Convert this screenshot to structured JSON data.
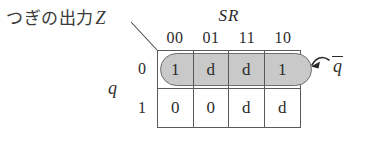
{
  "diagram": {
    "type": "karnaugh-map",
    "output_label": "つぎの出力",
    "output_variable": "Z",
    "column_variable": "SR",
    "row_variable": "q",
    "column_headers": [
      "00",
      "01",
      "11",
      "10"
    ],
    "row_headers": [
      "0",
      "1"
    ],
    "rows": [
      {
        "row_header": "0",
        "cells": [
          "1",
          "d",
          "d",
          "1"
        ]
      },
      {
        "row_header": "1",
        "cells": [
          "0",
          "0",
          "d",
          "d"
        ]
      }
    ],
    "group": {
      "label_variable": "q",
      "label_overline": true,
      "covers_row": "0",
      "covers_columns": [
        "00",
        "01",
        "11",
        "10"
      ],
      "fill_color": "#c9c9c9",
      "border_color": "#6e6e6e"
    },
    "line_color": "#5a5a5a",
    "text_color": "#2b2b2b",
    "background_color": "#ffffff"
  }
}
